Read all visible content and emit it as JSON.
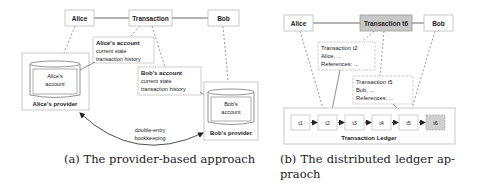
{
  "panel_a": {
    "actors": {
      "alice": "Alice",
      "transaction": "Transaction",
      "bob": "Bob"
    },
    "alice_note": {
      "title": "Alice's account",
      "line1": "current state",
      "line2": "transaction history"
    },
    "bob_note": {
      "title": "Bob's account",
      "line1": "current state",
      "line2": "transaction history"
    },
    "alice_provider": {
      "db_line1": "Alice's",
      "db_line2": "account",
      "label": "Alice's provider"
    },
    "bob_provider": {
      "db_line1": "Bob's",
      "db_line2": "account",
      "label": "Bob's provider"
    },
    "link": {
      "line1": "double-entry",
      "line2": "bookkeeping"
    },
    "caption": "(a) The provider-based approach"
  },
  "panel_b": {
    "actors": {
      "alice": "Alice",
      "transaction": "Transaction t6",
      "bob": "Bob"
    },
    "t2_note": {
      "title": "Transaction t2",
      "line1": "Alice, ...",
      "line2": "References: ..."
    },
    "t5_note": {
      "title": "Transaction t5",
      "line1": "Bob, ...",
      "line2": "References: ..."
    },
    "ledger": {
      "label": "Transaction Ledger",
      "blocks": [
        "t1",
        "t2",
        "t3",
        "t4",
        "t5",
        "t6"
      ]
    },
    "caption_line1": "(b) The distributed ledger ap-",
    "caption_line2": "praoch"
  },
  "colors": {
    "stroke": "#9a9a9a",
    "highlight_fill": "#c8c8c8",
    "text": "#222222"
  }
}
